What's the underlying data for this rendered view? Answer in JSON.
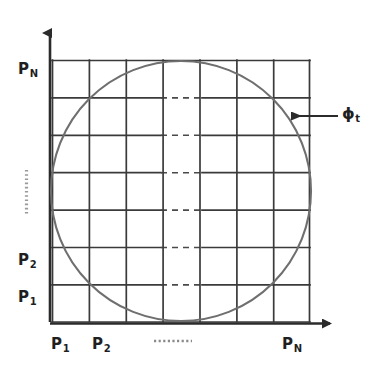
{
  "figure": {
    "name": "discrete-grid-inscribed-circle",
    "background_color": "#ffffff",
    "ink_color": "#1f1f1f",
    "grid_line_color": "#3a3a3a",
    "circle_color": "#6f6f6f",
    "axis_color": "#2b2b2b"
  },
  "axes": {
    "y_axis": {
      "name": "vertical-axis",
      "arrow": "up",
      "tick_labels": [
        {
          "id": "pn",
          "text": "P",
          "subscript": "N"
        },
        {
          "id": "p2",
          "text": "P",
          "subscript": "2"
        },
        {
          "id": "p1",
          "text": "P",
          "subscript": "1"
        }
      ],
      "ellipsis": "vertical-dotted-ellipsis"
    },
    "x_axis": {
      "name": "horizontal-axis",
      "arrow": "right",
      "tick_labels": [
        {
          "id": "p1",
          "text": "P",
          "subscript": "1"
        },
        {
          "id": "p2",
          "text": "P",
          "subscript": "2"
        },
        {
          "id": "pn",
          "text": "P",
          "subscript": "N"
        }
      ],
      "ellipsis": "horizontal-dashed-ellipsis"
    }
  },
  "grid": {
    "columns": 7,
    "rows": 7,
    "left": 52,
    "top": 60,
    "right": 310,
    "bottom": 322,
    "dashed_column_index": 3
  },
  "circle": {
    "name": "inscribed-circle",
    "center_x": 181,
    "center_y": 191,
    "radius": 130,
    "label": {
      "text": "ϕ",
      "subscript": "t"
    }
  },
  "callout": {
    "name": "phi-t-callout",
    "arrow_from_x": 338,
    "arrow_to_x": 291,
    "arrow_y": 116,
    "label_text": "ϕ",
    "label_subscript": "t"
  }
}
